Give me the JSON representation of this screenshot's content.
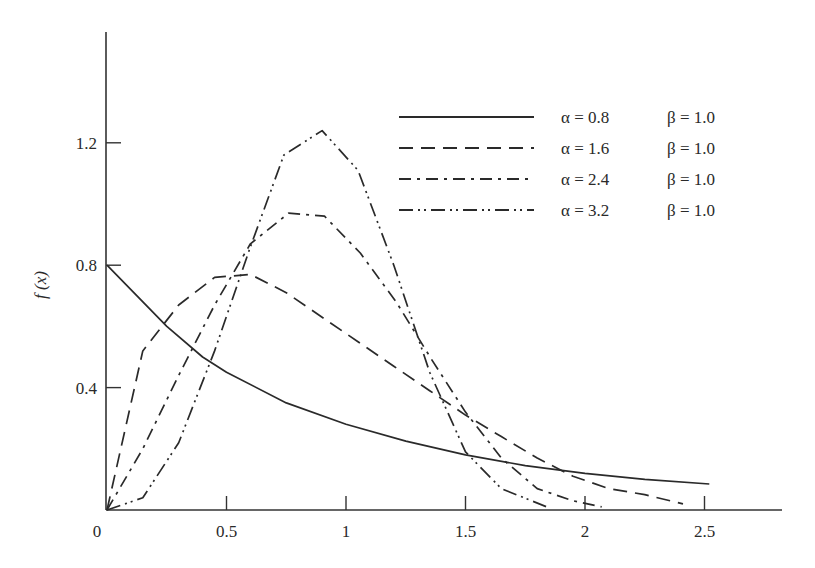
{
  "chart_data": {
    "type": "line",
    "title": "",
    "xlabel": "",
    "ylabel": "f (x)",
    "xlim": [
      0,
      2.8
    ],
    "ylim": [
      0,
      1.5
    ],
    "grid": false,
    "legend_position": "upper right",
    "x_ticks": [
      {
        "value": 0,
        "label": "0"
      },
      {
        "value": 0.5,
        "label": "0.5"
      },
      {
        "value": 1,
        "label": "1"
      },
      {
        "value": 1.5,
        "label": "1.5"
      },
      {
        "value": 2,
        "label": "2"
      },
      {
        "value": 2.5,
        "label": "2.5"
      }
    ],
    "y_ticks": [
      {
        "value": 0.4,
        "label": "0.4"
      },
      {
        "value": 0.8,
        "label": "0.8"
      },
      {
        "value": 1.2,
        "label": "1.2"
      }
    ],
    "series": [
      {
        "name": "α = 0.8   β = 1.0",
        "alpha_label": "α = 0.8",
        "beta_label": "β = 1.0",
        "style": "solid",
        "dash": "",
        "points": [
          [
            0,
            0.8
          ],
          [
            0.1,
            0.72
          ],
          [
            0.25,
            0.6
          ],
          [
            0.4,
            0.5
          ],
          [
            0.5,
            0.45
          ],
          [
            0.75,
            0.35
          ],
          [
            1.0,
            0.28
          ],
          [
            1.25,
            0.225
          ],
          [
            1.5,
            0.18
          ],
          [
            1.75,
            0.145
          ],
          [
            2.0,
            0.12
          ],
          [
            2.25,
            0.1
          ],
          [
            2.52,
            0.085
          ]
        ]
      },
      {
        "name": "α = 1.6   β = 1.0",
        "alpha_label": "α = 1.6",
        "beta_label": "β = 1.0",
        "style": "dashed",
        "dash": "14,8",
        "points": [
          [
            0,
            0
          ],
          [
            0.15,
            0.52
          ],
          [
            0.3,
            0.67
          ],
          [
            0.45,
            0.76
          ],
          [
            0.6,
            0.77
          ],
          [
            0.75,
            0.71
          ],
          [
            0.9,
            0.63
          ],
          [
            1.05,
            0.55
          ],
          [
            1.2,
            0.47
          ],
          [
            1.35,
            0.39
          ],
          [
            1.5,
            0.31
          ],
          [
            1.65,
            0.24
          ],
          [
            1.8,
            0.17
          ],
          [
            1.95,
            0.11
          ],
          [
            2.1,
            0.07
          ],
          [
            2.25,
            0.05
          ],
          [
            2.41,
            0.02
          ]
        ]
      },
      {
        "name": "α = 2.4   β = 1.0",
        "alpha_label": "α = 2.4",
        "beta_label": "β = 1.0",
        "style": "dash-dot",
        "dash": "12,6,3,6",
        "points": [
          [
            0,
            0
          ],
          [
            0.15,
            0.2
          ],
          [
            0.3,
            0.44
          ],
          [
            0.45,
            0.67
          ],
          [
            0.6,
            0.87
          ],
          [
            0.76,
            0.97
          ],
          [
            0.91,
            0.96
          ],
          [
            1.06,
            0.84
          ],
          [
            1.21,
            0.68
          ],
          [
            1.36,
            0.49
          ],
          [
            1.5,
            0.32
          ],
          [
            1.65,
            0.17
          ],
          [
            1.8,
            0.07
          ],
          [
            1.95,
            0.03
          ],
          [
            2.07,
            0.01
          ]
        ]
      },
      {
        "name": "α = 3.2   β = 1.0",
        "alpha_label": "α = 3.2",
        "beta_label": "β = 1.0",
        "style": "dash-dot-dot",
        "dash": "14,5,2,4,2,5",
        "points": [
          [
            0,
            0
          ],
          [
            0.15,
            0.04
          ],
          [
            0.3,
            0.22
          ],
          [
            0.45,
            0.52
          ],
          [
            0.6,
            0.86
          ],
          [
            0.74,
            1.16
          ],
          [
            0.9,
            1.24
          ],
          [
            1.05,
            1.11
          ],
          [
            1.2,
            0.8
          ],
          [
            1.35,
            0.45
          ],
          [
            1.5,
            0.19
          ],
          [
            1.65,
            0.07
          ],
          [
            1.84,
            0.01
          ]
        ]
      }
    ]
  }
}
